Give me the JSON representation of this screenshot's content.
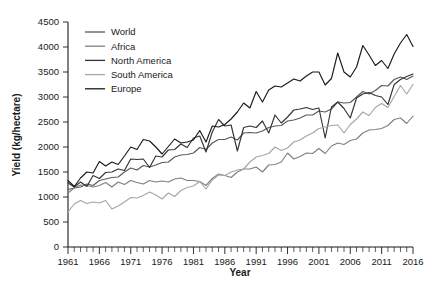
{
  "chart_data": {
    "type": "line",
    "title": "",
    "xlabel": "Year",
    "ylabel": "Yield (kg/hectare)",
    "xlim": [
      1961,
      2016
    ],
    "ylim": [
      0,
      4500
    ],
    "ytick_step": 500,
    "xtick_step": 5,
    "grid": false,
    "legend_position": "top-left",
    "yticks": [
      "0",
      "500",
      "1000",
      "1500",
      "2000",
      "2500",
      "3000",
      "3500",
      "4000",
      "4500"
    ],
    "xticks": [
      "1961",
      "1966",
      "1971",
      "1976",
      "1981",
      "1986",
      "1991",
      "1996",
      "2001",
      "2006",
      "2011",
      "2016"
    ],
    "x": [
      1961,
      1962,
      1963,
      1964,
      1965,
      1966,
      1967,
      1968,
      1969,
      1970,
      1971,
      1972,
      1973,
      1974,
      1975,
      1976,
      1977,
      1978,
      1979,
      1980,
      1981,
      1982,
      1983,
      1984,
      1985,
      1986,
      1987,
      1988,
      1989,
      1990,
      1991,
      1992,
      1993,
      1994,
      1995,
      1996,
      1997,
      1998,
      1999,
      2000,
      2001,
      2002,
      2003,
      2004,
      2005,
      2006,
      2007,
      2008,
      2009,
      2010,
      2011,
      2012,
      2013,
      2014,
      2015,
      2016
    ],
    "series": [
      {
        "name": "World",
        "color": "#595959",
        "values": [
          1150,
          1180,
          1200,
          1260,
          1230,
          1330,
          1360,
          1390,
          1400,
          1500,
          1580,
          1540,
          1630,
          1600,
          1640,
          1690,
          1700,
          1800,
          1840,
          1850,
          1880,
          1990,
          1950,
          2080,
          2150,
          2150,
          2200,
          2140,
          2280,
          2290,
          2280,
          2320,
          2390,
          2420,
          2430,
          2520,
          2540,
          2580,
          2640,
          2640,
          2720,
          2700,
          2760,
          2900,
          2880,
          2890,
          3000,
          3110,
          3060,
          3130,
          3230,
          3220,
          3350,
          3400,
          3350,
          3420
        ]
      },
      {
        "name": "Africa",
        "color": "#808080",
        "values": [
          1080,
          1180,
          1240,
          1230,
          1200,
          1230,
          1290,
          1200,
          1300,
          1250,
          1330,
          1290,
          1260,
          1330,
          1300,
          1320,
          1300,
          1360,
          1380,
          1330,
          1330,
          1310,
          1230,
          1370,
          1460,
          1430,
          1390,
          1500,
          1560,
          1560,
          1600,
          1500,
          1640,
          1650,
          1700,
          1880,
          1760,
          1810,
          1880,
          1870,
          1970,
          1870,
          2020,
          2080,
          2050,
          2130,
          2160,
          2280,
          2340,
          2350,
          2370,
          2430,
          2550,
          2580,
          2470,
          2620
        ]
      },
      {
        "name": "North America",
        "color": "#333333",
        "values": [
          1280,
          1200,
          1300,
          1210,
          1430,
          1370,
          1490,
          1500,
          1560,
          1530,
          1760,
          1750,
          1760,
          1590,
          1820,
          1800,
          1940,
          1950,
          2060,
          1990,
          2180,
          2220,
          1900,
          2300,
          2550,
          2420,
          2440,
          1920,
          2390,
          2420,
          2390,
          2520,
          2280,
          2640,
          2480,
          2600,
          2740,
          2760,
          2790,
          2750,
          2780,
          2180,
          2800,
          2900,
          2770,
          2580,
          2980,
          3060,
          3090,
          3030,
          3000,
          2850,
          3250,
          3350,
          3410,
          3460
        ]
      },
      {
        "name": "South America",
        "color": "#a6a6a6",
        "values": [
          700,
          860,
          930,
          870,
          900,
          880,
          930,
          760,
          820,
          900,
          990,
          980,
          1030,
          1100,
          1040,
          960,
          1080,
          1010,
          1130,
          1190,
          1220,
          1310,
          1160,
          1340,
          1440,
          1430,
          1500,
          1540,
          1560,
          1700,
          1800,
          1830,
          1870,
          2000,
          1930,
          1980,
          2100,
          2140,
          2220,
          2280,
          2370,
          2400,
          2430,
          2440,
          2280,
          2450,
          2560,
          2700,
          2630,
          2790,
          2870,
          2790,
          3010,
          3230,
          3060,
          3250
        ]
      },
      {
        "name": "Europe",
        "color": "#1a1a1a",
        "values": [
          1330,
          1210,
          1380,
          1500,
          1480,
          1710,
          1620,
          1700,
          1650,
          1820,
          2000,
          1950,
          2150,
          2120,
          2000,
          1860,
          2010,
          2160,
          2080,
          2100,
          2140,
          2330,
          2100,
          2420,
          2400,
          2450,
          2560,
          2700,
          2880,
          2780,
          3110,
          2900,
          3140,
          3220,
          3200,
          3280,
          3360,
          3320,
          3420,
          3500,
          3500,
          3240,
          3370,
          3880,
          3500,
          3400,
          3600,
          4030,
          3840,
          3630,
          3730,
          3570,
          3860,
          4080,
          4250,
          4010
        ]
      }
    ]
  },
  "legend": {
    "items": [
      {
        "label": "World"
      },
      {
        "label": "Africa"
      },
      {
        "label": "North America"
      },
      {
        "label": "South America"
      },
      {
        "label": "Europe"
      }
    ]
  }
}
